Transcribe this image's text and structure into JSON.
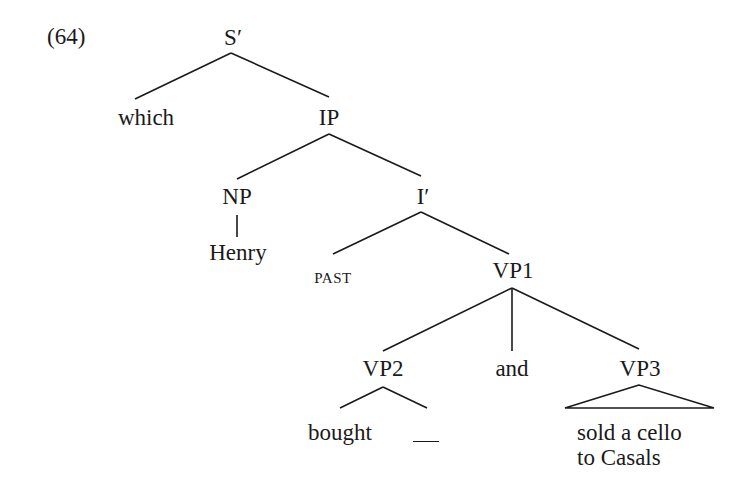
{
  "example": {
    "number": "(64)"
  },
  "tree": {
    "nodes": {
      "s_bar": "S′",
      "which": "which",
      "ip": "IP",
      "np": "NP",
      "henry": "Henry",
      "i_bar": "I′",
      "past": "PAST",
      "vp1": "VP1",
      "vp2": "VP2",
      "and": "and",
      "vp3": "VP3",
      "bought": "bought",
      "gap": "__",
      "vp3_text_line1": "sold a cello",
      "vp3_text_line2": "to Casals"
    },
    "edges": [
      {
        "from": "S′",
        "to": "which"
      },
      {
        "from": "S′",
        "to": "IP"
      },
      {
        "from": "IP",
        "to": "NP"
      },
      {
        "from": "IP",
        "to": "I′"
      },
      {
        "from": "NP",
        "to": "Henry"
      },
      {
        "from": "I′",
        "to": "PAST"
      },
      {
        "from": "I′",
        "to": "VP1"
      },
      {
        "from": "VP1",
        "to": "VP2"
      },
      {
        "from": "VP1",
        "to": "and"
      },
      {
        "from": "VP1",
        "to": "VP3"
      },
      {
        "from": "VP2",
        "to": "bought"
      },
      {
        "from": "VP2",
        "to": "__"
      },
      {
        "from": "VP3",
        "to": "sold a cello to Casals",
        "style": "triangle"
      }
    ]
  }
}
